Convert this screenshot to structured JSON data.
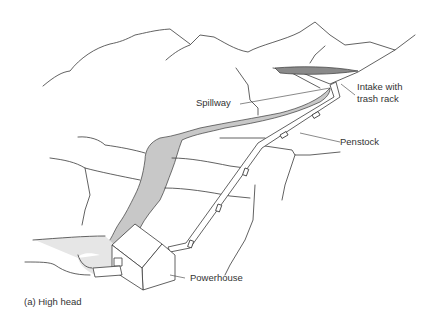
{
  "figure": {
    "caption": "(a) High head",
    "labels": {
      "spillway": "Spillway",
      "intake_line1": "Intake with",
      "intake_line2": "trash rack",
      "penstock": "Penstock",
      "powerhouse": "Powerhouse"
    },
    "colors": {
      "line": "#3a3a3a",
      "water": "#c8c8c8",
      "reservoir": "#8a8a8a",
      "background": "#ffffff"
    }
  }
}
